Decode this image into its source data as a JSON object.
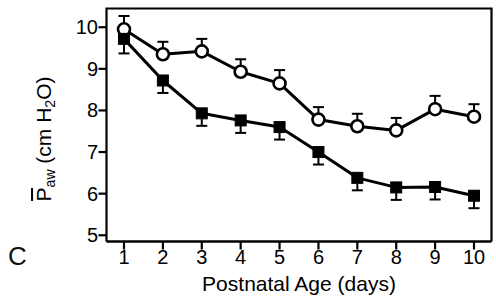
{
  "figure": {
    "panel_label": "C",
    "background_color": "#ffffff",
    "ink_color": "#000000"
  },
  "chart_data": {
    "type": "line",
    "title": "",
    "xlabel": "Postnatal Age (days)",
    "ylabel": "P̄aw (cm H2O)",
    "ylabel_parts": {
      "symbol": "P",
      "subscript": "aw",
      "units": "(cm H",
      "units_sub": "2",
      "units_end": "O)"
    },
    "x": [
      1,
      2,
      3,
      4,
      5,
      6,
      7,
      8,
      9,
      10
    ],
    "xtick_labels": [
      "1",
      "2",
      "3",
      "4",
      "5",
      "6",
      "7",
      "8",
      "9",
      "10"
    ],
    "ytick_labels": [
      "10",
      "9",
      "8",
      "7",
      "6",
      "5"
    ],
    "yticks": [
      10,
      9,
      8,
      7,
      6,
      5
    ],
    "xlim": [
      0.55,
      10.45
    ],
    "ylim": [
      4.85,
      10.45
    ],
    "grid": false,
    "legend": "none",
    "series": [
      {
        "name": "open-circle",
        "marker": "open-circle",
        "values": [
          9.95,
          9.35,
          9.42,
          8.93,
          8.65,
          7.78,
          7.62,
          7.52,
          8.03,
          7.85
        ],
        "errors_up": [
          0.32,
          0.3,
          0.3,
          0.3,
          0.32,
          0.3,
          0.3,
          0.3,
          0.32,
          0.3
        ],
        "errors_down": [
          0.0,
          0.0,
          0.0,
          0.0,
          0.0,
          0.0,
          0.0,
          0.0,
          0.0,
          0.0
        ]
      },
      {
        "name": "filled-square",
        "marker": "filled-square",
        "values": [
          9.72,
          8.72,
          7.93,
          7.76,
          7.6,
          7.0,
          6.38,
          6.15,
          6.16,
          5.95
        ],
        "errors_up": [
          0.0,
          0.0,
          0.0,
          0.0,
          0.0,
          0.0,
          0.0,
          0.0,
          0.0,
          0.0
        ],
        "errors_down": [
          0.35,
          0.3,
          0.3,
          0.3,
          0.3,
          0.3,
          0.3,
          0.3,
          0.3,
          0.3
        ]
      }
    ]
  }
}
